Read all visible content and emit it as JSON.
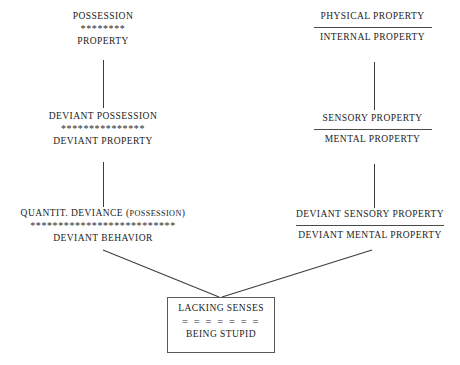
{
  "diagram": {
    "background_color": "#ffffff",
    "text_color": "#222222",
    "line_color": "#3c3c3c"
  },
  "left_column": {
    "group1": {
      "top_label": "POSSESSION",
      "separator": "********",
      "bottom_label": "PROPERTY"
    },
    "group2": {
      "top_label": "DEVIANT POSSESSION",
      "separator": "***************",
      "bottom_label": "DEVIANT PROPERTY"
    },
    "group3": {
      "top_label_main": "QUANTIT. DEVIANCE (",
      "top_label_small": "POSSESSION",
      "top_label_close": ")",
      "separator": "**************************",
      "bottom_label": "DEVIANT BEHAVIOR"
    }
  },
  "right_column": {
    "group1": {
      "top_label": "PHYSICAL PROPERTY",
      "separator": "rule",
      "bottom_label": "INTERNAL PROPERTY"
    },
    "group2": {
      "top_label": "SENSORY PROPERTY",
      "separator": "rule",
      "bottom_label": "MENTAL PROPERTY"
    },
    "group3": {
      "top_label": "DEVIANT SENSORY PROPERTY",
      "separator": "rule",
      "bottom_label": "DEVIANT MENTAL PROPERTY"
    }
  },
  "result_box": {
    "top_label": "LACKING SENSES",
    "separator": "= = = = = = =",
    "bottom_label": "BEING STUPID"
  }
}
